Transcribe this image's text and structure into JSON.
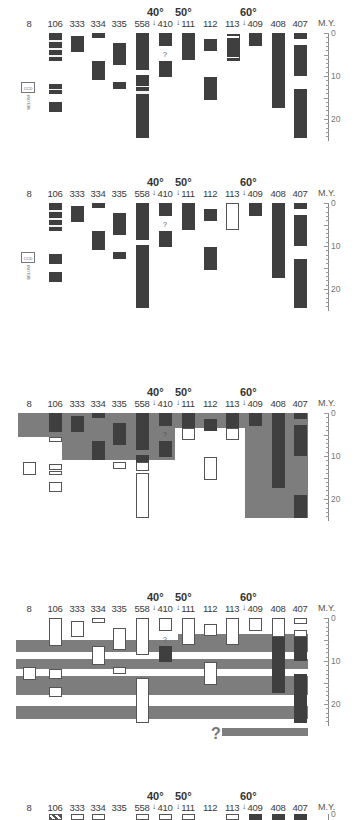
{
  "figure": {
    "axis_label": "M.Y.",
    "axis_ticks": [
      "0",
      "10",
      "20"
    ],
    "uncertain_mark": "?",
    "below_ccd_label": "BELOW",
    "ccd_label": "CCD",
    "latitudes": [
      {
        "label": "40°",
        "between": [
          "558",
          "410"
        ]
      },
      {
        "label": "50°",
        "between": [
          "410",
          "111"
        ]
      },
      {
        "label": "60°",
        "between": [
          "113",
          "409"
        ]
      }
    ],
    "sites": [
      "8",
      "106",
      "333",
      "334",
      "335",
      "558",
      "410",
      "111",
      "112",
      "113",
      "409",
      "408",
      "407"
    ],
    "panels": [
      {
        "id": "panel-1",
        "description": "Hiatus/recovery record per DSDP site (dark = sediment present)"
      },
      {
        "id": "panel-2",
        "description": "Same record with site 113 open"
      },
      {
        "id": "panel-3",
        "description": "Shaded interpretive regions overlay"
      },
      {
        "id": "panel-4",
        "description": "Horizontal shaded hiatus bands across sites"
      },
      {
        "id": "panel-5",
        "description": "Partial panel (cut off)"
      }
    ]
  }
}
